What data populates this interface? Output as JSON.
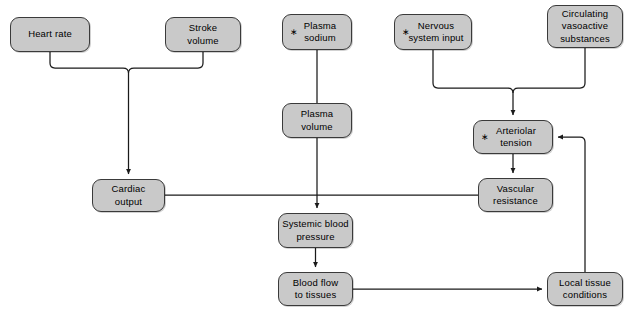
{
  "diagram": {
    "type": "flowchart",
    "colors": {
      "node_fill": "#c9c9c9",
      "node_border": "#3a3a3a",
      "edge": "#1a1a1a",
      "background": "#ffffff"
    },
    "star_marker": "∗",
    "nodes": [
      {
        "id": "heart_rate",
        "label": "Heart rate",
        "starred": false,
        "x": 10,
        "y": 17,
        "w": 80,
        "h": 35
      },
      {
        "id": "stroke_volume",
        "label": "Stroke\nvolume",
        "starred": false,
        "x": 165,
        "y": 17,
        "w": 76,
        "h": 35
      },
      {
        "id": "plasma_sodium",
        "label": "Plasma\nsodium",
        "starred": true,
        "x": 282,
        "y": 14,
        "w": 70,
        "h": 36
      },
      {
        "id": "nervous_input",
        "label": "Nervous\nsystem input",
        "starred": true,
        "x": 394,
        "y": 14,
        "w": 78,
        "h": 36
      },
      {
        "id": "circ_vasoactive",
        "label": "Circulating\nvasoactive\nsubstances",
        "starred": false,
        "x": 547,
        "y": 5,
        "w": 76,
        "h": 43
      },
      {
        "id": "plasma_volume",
        "label": "Plasma\nvolume",
        "starred": false,
        "x": 282,
        "y": 103,
        "w": 70,
        "h": 35
      },
      {
        "id": "arteriolar_tension",
        "label": "Arteriolar\ntension",
        "starred": true,
        "x": 473,
        "y": 120,
        "w": 80,
        "h": 34
      },
      {
        "id": "cardiac_output",
        "label": "Cardiac\noutput",
        "starred": false,
        "x": 92,
        "y": 179,
        "w": 73,
        "h": 33
      },
      {
        "id": "vascular_resist",
        "label": "Vascular\nresistance",
        "starred": false,
        "x": 478,
        "y": 178,
        "w": 75,
        "h": 34
      },
      {
        "id": "systemic_bp",
        "label": "Systemic blood\npressure",
        "starred": false,
        "x": 278,
        "y": 213,
        "w": 75,
        "h": 35
      },
      {
        "id": "blood_flow",
        "label": "Blood flow\nto tissues",
        "starred": false,
        "x": 278,
        "y": 272,
        "w": 75,
        "h": 34
      },
      {
        "id": "local_tissue",
        "label": "Local tissue\nconditions",
        "starred": false,
        "x": 547,
        "y": 272,
        "w": 76,
        "h": 34
      }
    ],
    "edges": [
      {
        "id": "heart-rate-to-cardiac-output",
        "from": "heart_rate",
        "to": "cardiac_output",
        "arrow": true
      },
      {
        "id": "stroke-volume-to-cardiac-output",
        "from": "stroke_volume",
        "to": "cardiac_output",
        "arrow": true
      },
      {
        "id": "plasma-sodium-to-plasma-volume",
        "from": "plasma_sodium",
        "to": "plasma_volume",
        "arrow": false
      },
      {
        "id": "plasma-volume-to-systemic-bp",
        "from": "plasma_volume",
        "to": "systemic_bp",
        "arrow": true
      },
      {
        "id": "nervous-input-to-arteriolar-tension",
        "from": "nervous_input",
        "to": "arteriolar_tension",
        "arrow": true
      },
      {
        "id": "vasoactive-to-arteriolar-tension",
        "from": "circ_vasoactive",
        "to": "arteriolar_tension",
        "arrow": true
      },
      {
        "id": "arteriolar-tension-to-vascular-resist",
        "from": "arteriolar_tension",
        "to": "vascular_resist",
        "arrow": true
      },
      {
        "id": "cardiac-output-to-systemic-bp",
        "from": "cardiac_output",
        "to": "systemic_bp",
        "arrow": true
      },
      {
        "id": "vascular-resist-to-systemic-bp",
        "from": "vascular_resist",
        "to": "systemic_bp",
        "arrow": true
      },
      {
        "id": "systemic-bp-to-blood-flow",
        "from": "systemic_bp",
        "to": "blood_flow",
        "arrow": true
      },
      {
        "id": "blood-flow-to-local-tissue",
        "from": "blood_flow",
        "to": "local_tissue",
        "arrow": true
      },
      {
        "id": "local-tissue-to-arteriolar-tension",
        "from": "local_tissue",
        "to": "arteriolar_tension",
        "arrow": true
      }
    ]
  }
}
